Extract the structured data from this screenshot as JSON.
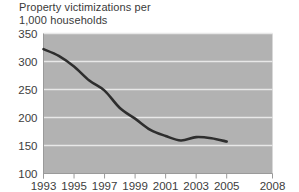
{
  "chart_data": {
    "type": "line",
    "title": "Property victimizations per\n1,000 households",
    "xlabel": "",
    "ylabel": "",
    "xlim": [
      1993,
      2008
    ],
    "ylim": [
      100,
      350
    ],
    "grid": true,
    "legend": "none",
    "x_ticks": [
      "1993",
      "1995",
      "1997",
      "1999",
      "2001",
      "2003",
      "2005",
      "2008"
    ],
    "x_tick_values": [
      1993,
      1995,
      1997,
      1999,
      2001,
      2003,
      2005,
      2008
    ],
    "y_ticks": [
      "100",
      "150",
      "200",
      "250",
      "300",
      "350"
    ],
    "y_tick_values": [
      100,
      150,
      200,
      250,
      300,
      350
    ],
    "x": [
      1993,
      1994,
      1995,
      1996,
      1997,
      1998,
      1999,
      2000,
      2001,
      2002,
      2003,
      2004,
      2005
    ],
    "values": [
      322,
      310,
      291,
      266,
      248,
      217,
      198,
      178,
      167,
      159,
      165,
      163,
      157
    ],
    "series": [
      {
        "name": "Property victimizations per 1,000 households",
        "values": [
          322,
          310,
          291,
          266,
          248,
          217,
          198,
          178,
          167,
          159,
          165,
          163,
          157
        ]
      }
    ],
    "colors": {
      "line": "#2e2e2e",
      "plot_background": "#b2b2b2",
      "gridline": "#e8e8e8",
      "text": "#3a3a3a",
      "page_background": "#ffffff"
    }
  }
}
